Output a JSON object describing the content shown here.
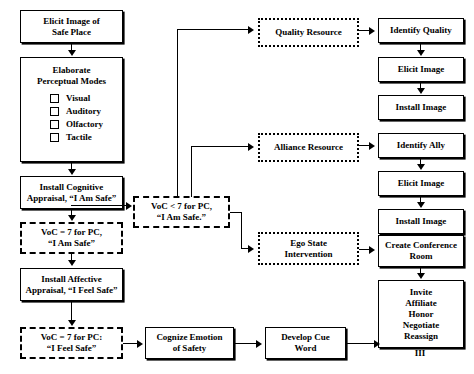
{
  "diagram": {
    "colors": {
      "stroke": "#000000",
      "background": "#ffffff"
    },
    "column_left": [
      {
        "id": "elicit-image-safe-place",
        "text": "Elicit Image of\nSafe Place",
        "style": "solid"
      },
      {
        "id": "elaborate-perceptual-modes",
        "text": "Elaborate\nPerceptual Modes",
        "style": "solid"
      },
      {
        "id": "install-cognitive-appraisal",
        "text": "Install Cognitive\nAppraisal, “I Am Safe”",
        "style": "solid"
      },
      {
        "id": "voc-7-i-am-safe",
        "text": "VoC = 7 for PC,\n“I Am Safe”",
        "style": "dashed"
      },
      {
        "id": "install-affective-appraisal",
        "text": "Install Affective\nAppraisal, “I Feel Safe”",
        "style": "solid"
      },
      {
        "id": "voc-7-i-feel-safe",
        "text": "VoC = 7 for PC:\n“I Feel Safe”",
        "style": "dashed"
      }
    ],
    "checklist": {
      "items": [
        {
          "label": "Visual",
          "checked": false
        },
        {
          "label": "Auditory",
          "checked": false
        },
        {
          "label": "Olfactory",
          "checked": false
        },
        {
          "label": "Tactile",
          "checked": false
        }
      ]
    },
    "column_middle": [
      {
        "id": "voc-less-7-i-am-safe",
        "text": "VoC < 7 for PC,\n“I Am Safe.”",
        "style": "dashed"
      },
      {
        "id": "cognize-emotion-of-safety",
        "text": "Cognize Emotion\nof Safety",
        "style": "solid"
      },
      {
        "id": "develop-cue-word",
        "text": "Develop Cue\nWord",
        "style": "solid"
      }
    ],
    "column_resources": [
      {
        "id": "quality-resource",
        "text": "Quality Resource",
        "style": "dotted"
      },
      {
        "id": "alliance-resource",
        "text": "Alliance Resource",
        "style": "dotted"
      },
      {
        "id": "ego-state-intervention",
        "text": "Ego State\nIntervention",
        "style": "dotted"
      }
    ],
    "column_right": [
      {
        "id": "identify-quality",
        "text": "Identify Quality",
        "style": "solid"
      },
      {
        "id": "elicit-image-1",
        "text": "Elicit Image",
        "style": "solid"
      },
      {
        "id": "install-image-1",
        "text": "Install Image",
        "style": "solid"
      },
      {
        "id": "identify-ally",
        "text": "Identify  Ally",
        "style": "solid"
      },
      {
        "id": "elicit-image-2",
        "text": "Elicit Image",
        "style": "solid"
      },
      {
        "id": "install-image-2",
        "text": "Install Image",
        "style": "solid"
      },
      {
        "id": "create-conference-room",
        "text": "Create Conference\nRoom",
        "style": "solid"
      },
      {
        "id": "conference-actions",
        "text": "Invite\nAffiliate\nHonor\nNegotiate\nReassign",
        "style": "solid"
      }
    ],
    "terminal_label": "To Skill\nIII"
  }
}
